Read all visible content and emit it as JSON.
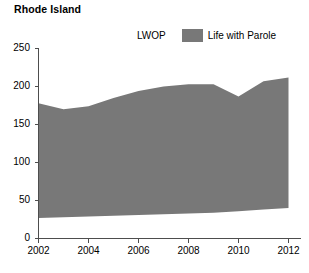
{
  "chart_data": {
    "type": "area",
    "title": "Rhode Island",
    "xlabel": "",
    "ylabel": "",
    "xlim": [
      2002,
      2012
    ],
    "ylim": [
      0,
      250
    ],
    "grid": false,
    "legend_position": "top-center",
    "x_ticks": [
      "2002",
      "2004",
      "2006",
      "2008",
      "2010",
      "2012"
    ],
    "x_tick_values": [
      2002,
      2004,
      2006,
      2008,
      2010,
      2012
    ],
    "y_ticks": [
      "0",
      "50",
      "100",
      "150",
      "200",
      "250"
    ],
    "y_tick_values": [
      0,
      50,
      100,
      150,
      200,
      250
    ],
    "x": [
      2002,
      2003,
      2004,
      2005,
      2006,
      2007,
      2008,
      2009,
      2010,
      2011,
      2012
    ],
    "series": [
      {
        "name": "LWOP",
        "color": "#ffffff",
        "values": [
          27,
          28,
          29,
          30,
          31,
          32,
          33,
          34,
          36,
          38,
          40
        ]
      },
      {
        "name": "Life with Parole",
        "color": "#787878",
        "values": [
          151,
          142,
          145,
          155,
          163,
          168,
          170,
          169,
          151,
          169,
          172
        ]
      }
    ],
    "stacked_totals": [
      178,
      170,
      174,
      185,
      194,
      200,
      203,
      203,
      187,
      207,
      212
    ]
  },
  "legend": {
    "items": [
      {
        "label": "LWOP",
        "swatch": "white-swatch"
      },
      {
        "label": "Life with Parole",
        "swatch": "gray-swatch"
      }
    ]
  },
  "colors": {
    "area_fill": "#787878",
    "axis": "#4d4d4d",
    "text": "#000000",
    "background": "#ffffff"
  }
}
